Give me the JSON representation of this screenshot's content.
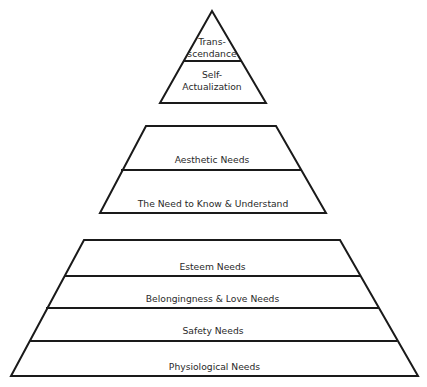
{
  "diagram": {
    "groups": [
      {
        "name": "transcendence-group",
        "levels": [
          {
            "label": "Trans-\nscendance"
          },
          {
            "label": "Self-\nActualization"
          }
        ]
      },
      {
        "name": "cognitive-aesthetic-group",
        "levels": [
          {
            "label": "Aesthetic Needs"
          },
          {
            "label": "The Need to Know & Understand"
          }
        ]
      },
      {
        "name": "basic-needs-group",
        "levels": [
          {
            "label": "Esteem Needs"
          },
          {
            "label": "Belongingness & Love Needs"
          },
          {
            "label": "Safety Needs"
          },
          {
            "label": "Physiological Needs"
          }
        ]
      }
    ],
    "stroke_color": "#1a1a1a",
    "fill_color": "#ffffff"
  }
}
